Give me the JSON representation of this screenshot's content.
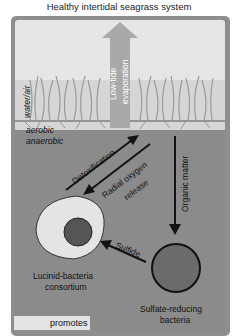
{
  "title": "Healthy intertidal seagrass system",
  "zones": {
    "water_air": "water/air",
    "aerobic": "aerobic",
    "anaerobic": "anaerobic"
  },
  "arrows": {
    "evaporation": "Low-tide evaporation",
    "evaporation_line1": "Low-tide",
    "evaporation_line2": "evaporation",
    "detox": "Detoxification",
    "radial_line1": "Radial oxygen",
    "radial_line2": "release",
    "organic": "Organic matter",
    "sulfide": "Sulfide"
  },
  "nodes": {
    "lucinid_line1": "Lucinid-bacteria",
    "lucinid_line2": "consortium",
    "srb_line1": "Sulfate-reducing",
    "srb_line2": "bacteria"
  },
  "legend": {
    "promotes": "promotes"
  },
  "colors": {
    "frame": "#8e8e8e",
    "sky": "#e6e6e6",
    "sediment": "#8b8b8b",
    "arrow": "#111111",
    "evap_arrow": "#a9a9a9"
  }
}
